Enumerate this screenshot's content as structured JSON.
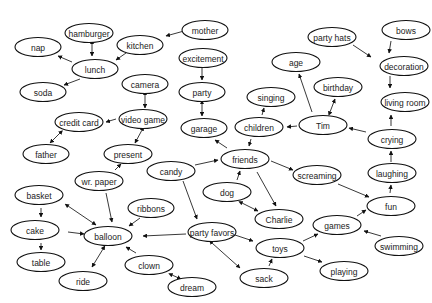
{
  "diagram": {
    "type": "concept-map",
    "nodes": [
      {
        "id": "hamburger",
        "label": "hamburger",
        "x": 89,
        "y": 33,
        "rx": 24
      },
      {
        "id": "nap",
        "label": "nap",
        "x": 38,
        "y": 47,
        "rx": 23
      },
      {
        "id": "kitchen",
        "label": "kitchen",
        "x": 140,
        "y": 45,
        "rx": 23
      },
      {
        "id": "mother",
        "label": "mother",
        "x": 205,
        "y": 30,
        "rx": 23
      },
      {
        "id": "lunch",
        "label": "lunch",
        "x": 95,
        "y": 69,
        "rx": 23
      },
      {
        "id": "soda",
        "label": "soda",
        "x": 43,
        "y": 92,
        "rx": 23
      },
      {
        "id": "excitement",
        "label": "excitement",
        "x": 203,
        "y": 58,
        "rx": 24
      },
      {
        "id": "party",
        "label": "party",
        "x": 202,
        "y": 92,
        "rx": 23
      },
      {
        "id": "garage",
        "label": "garage",
        "x": 204,
        "y": 128,
        "rx": 23
      },
      {
        "id": "camera",
        "label": "camera",
        "x": 145,
        "y": 84,
        "rx": 23
      },
      {
        "id": "video_game",
        "label": "video game",
        "x": 143,
        "y": 119,
        "rx": 24
      },
      {
        "id": "credit_card",
        "label": "credit card",
        "x": 79,
        "y": 122,
        "rx": 24
      },
      {
        "id": "father",
        "label": "father",
        "x": 46,
        "y": 154,
        "rx": 23
      },
      {
        "id": "present",
        "label": "present",
        "x": 128,
        "y": 154,
        "rx": 24
      },
      {
        "id": "wr_paper",
        "label": "wr. paper",
        "x": 99,
        "y": 181,
        "rx": 24
      },
      {
        "id": "candy",
        "label": "candy",
        "x": 171,
        "y": 171,
        "rx": 24
      },
      {
        "id": "party_hats",
        "label": "party hats",
        "x": 332,
        "y": 37,
        "rx": 24
      },
      {
        "id": "bows",
        "label": "bows",
        "x": 406,
        "y": 30,
        "rx": 24
      },
      {
        "id": "decoration",
        "label": "decoration",
        "x": 404,
        "y": 66,
        "rx": 24
      },
      {
        "id": "age",
        "label": "age",
        "x": 296,
        "y": 62,
        "rx": 24
      },
      {
        "id": "birthday",
        "label": "birthday",
        "x": 338,
        "y": 87,
        "rx": 24
      },
      {
        "id": "living_room",
        "label": "living room",
        "x": 405,
        "y": 102,
        "rx": 24
      },
      {
        "id": "singing",
        "label": "singing",
        "x": 271,
        "y": 97,
        "rx": 24
      },
      {
        "id": "children",
        "label": "children",
        "x": 259,
        "y": 127,
        "rx": 24
      },
      {
        "id": "tim",
        "label": "Tim",
        "x": 323,
        "y": 125,
        "rx": 24
      },
      {
        "id": "crying",
        "label": "crying",
        "x": 392,
        "y": 139,
        "rx": 24
      },
      {
        "id": "friends",
        "label": "friends",
        "x": 245,
        "y": 159,
        "rx": 24
      },
      {
        "id": "screaming",
        "label": "screaming",
        "x": 317,
        "y": 175,
        "rx": 24
      },
      {
        "id": "laughing",
        "label": "laughing",
        "x": 392,
        "y": 173,
        "rx": 24
      },
      {
        "id": "dog",
        "label": "dog",
        "x": 227,
        "y": 192,
        "rx": 24
      },
      {
        "id": "charlie",
        "label": "Charlie",
        "x": 279,
        "y": 219,
        "rx": 24
      },
      {
        "id": "fun",
        "label": "fun",
        "x": 391,
        "y": 206,
        "rx": 24
      },
      {
        "id": "basket",
        "label": "basket",
        "x": 39,
        "y": 195,
        "rx": 24
      },
      {
        "id": "ribbons",
        "label": "ribbons",
        "x": 151,
        "y": 208,
        "rx": 23
      },
      {
        "id": "cake",
        "label": "cake",
        "x": 35,
        "y": 230,
        "rx": 24
      },
      {
        "id": "balloon",
        "label": "balloon",
        "x": 108,
        "y": 236,
        "rx": 24
      },
      {
        "id": "party_favors",
        "label": "party favors",
        "x": 212,
        "y": 232,
        "rx": 24
      },
      {
        "id": "games",
        "label": "games",
        "x": 337,
        "y": 225,
        "rx": 24
      },
      {
        "id": "toys",
        "label": "toys",
        "x": 280,
        "y": 248,
        "rx": 24
      },
      {
        "id": "swimming",
        "label": "swimming",
        "x": 399,
        "y": 246,
        "rx": 24
      },
      {
        "id": "table",
        "label": "table",
        "x": 41,
        "y": 262,
        "rx": 24
      },
      {
        "id": "clown",
        "label": "clown",
        "x": 149,
        "y": 265,
        "rx": 24
      },
      {
        "id": "ride",
        "label": "ride",
        "x": 83,
        "y": 281,
        "rx": 24
      },
      {
        "id": "playing",
        "label": "playing",
        "x": 344,
        "y": 271,
        "rx": 24
      },
      {
        "id": "sack",
        "label": "sack",
        "x": 264,
        "y": 278,
        "rx": 24
      },
      {
        "id": "dream",
        "label": "dream",
        "x": 192,
        "y": 287,
        "rx": 24
      }
    ],
    "edges": [
      {
        "from": "mother",
        "to": "kitchen",
        "x1": 184,
        "y1": 31,
        "x2": 166,
        "y2": 36,
        "both": false
      },
      {
        "from": "kitchen",
        "to": "lunch",
        "x1": 126,
        "y1": 53,
        "x2": 116,
        "y2": 60,
        "both": false
      },
      {
        "from": "hamburger",
        "to": "lunch",
        "x1": 92,
        "y1": 44,
        "x2": 92,
        "y2": 56,
        "both": true
      },
      {
        "from": "lunch",
        "to": "nap",
        "x1": 72,
        "y1": 62,
        "x2": 58,
        "y2": 56,
        "both": false
      },
      {
        "from": "lunch",
        "to": "soda",
        "x1": 80,
        "y1": 79,
        "x2": 64,
        "y2": 85,
        "both": false
      },
      {
        "from": "excitement",
        "to": "party",
        "x1": 202,
        "y1": 68,
        "x2": 202,
        "y2": 80,
        "both": false
      },
      {
        "from": "party",
        "to": "garage",
        "x1": 202,
        "y1": 104,
        "x2": 202,
        "y2": 116,
        "both": true
      },
      {
        "from": "camera",
        "to": "video_game",
        "x1": 145,
        "y1": 95,
        "x2": 145,
        "y2": 108,
        "both": true
      },
      {
        "from": "video_game",
        "to": "credit_card",
        "x1": 116,
        "y1": 119,
        "x2": 106,
        "y2": 122,
        "both": false
      },
      {
        "from": "credit_card",
        "to": "father",
        "x1": 60,
        "y1": 133,
        "x2": 50,
        "y2": 143,
        "both": true
      },
      {
        "from": "video_game",
        "to": "present",
        "x1": 142,
        "y1": 130,
        "x2": 135,
        "y2": 143,
        "both": true
      },
      {
        "from": "wr_paper",
        "to": "present",
        "x1": 115,
        "y1": 170,
        "x2": 121,
        "y2": 164,
        "both": false
      },
      {
        "from": "wr_paper",
        "to": "balloon",
        "x1": 106,
        "y1": 193,
        "x2": 112,
        "y2": 222,
        "both": false
      },
      {
        "from": "ribbons",
        "to": "balloon",
        "x1": 140,
        "y1": 218,
        "x2": 129,
        "y2": 226,
        "both": false
      },
      {
        "from": "basket",
        "to": "balloon",
        "x1": 68,
        "y1": 206,
        "x2": 96,
        "y2": 225,
        "both": true
      },
      {
        "from": "basket",
        "to": "cake",
        "x1": 41,
        "y1": 208,
        "x2": 41,
        "y2": 217,
        "both": false
      },
      {
        "from": "cake",
        "to": "balloon",
        "x1": 68,
        "y1": 232,
        "x2": 84,
        "y2": 234,
        "both": false
      },
      {
        "from": "cake",
        "to": "table",
        "x1": 41,
        "y1": 243,
        "x2": 41,
        "y2": 250,
        "both": false
      },
      {
        "from": "balloon",
        "to": "ride",
        "x1": 103,
        "y1": 249,
        "x2": 92,
        "y2": 267,
        "both": true
      },
      {
        "from": "clown",
        "to": "balloon",
        "x1": 136,
        "y1": 253,
        "x2": 126,
        "y2": 247,
        "both": false
      },
      {
        "from": "clown",
        "to": "dream",
        "x1": 172,
        "y1": 275,
        "x2": 181,
        "y2": 279,
        "both": true
      },
      {
        "from": "party_favors",
        "to": "balloon",
        "x1": 186,
        "y1": 234,
        "x2": 143,
        "y2": 236,
        "both": false
      },
      {
        "from": "candy",
        "to": "party_favors",
        "x1": 183,
        "y1": 181,
        "x2": 197,
        "y2": 219,
        "both": false
      },
      {
        "from": "candy",
        "to": "friends",
        "x1": 195,
        "y1": 165,
        "x2": 218,
        "y2": 160,
        "both": false
      },
      {
        "from": "party_favors",
        "to": "toys",
        "x1": 232,
        "y1": 234,
        "x2": 253,
        "y2": 241,
        "both": false
      },
      {
        "from": "party_favors",
        "to": "sack",
        "x1": 212,
        "y1": 243,
        "x2": 240,
        "y2": 268,
        "both": true
      },
      {
        "from": "sack",
        "to": "toys",
        "x1": 269,
        "y1": 266,
        "x2": 272,
        "y2": 259,
        "both": false
      },
      {
        "from": "toys",
        "to": "games",
        "x1": 303,
        "y1": 241,
        "x2": 318,
        "y2": 234,
        "both": false
      },
      {
        "from": "toys",
        "to": "playing",
        "x1": 304,
        "y1": 256,
        "x2": 322,
        "y2": 262,
        "both": false
      },
      {
        "from": "games",
        "to": "fun",
        "x1": 357,
        "y1": 216,
        "x2": 366,
        "y2": 210,
        "both": false
      },
      {
        "from": "swimming",
        "to": "games",
        "x1": 381,
        "y1": 236,
        "x2": 364,
        "y2": 231,
        "both": false
      },
      {
        "from": "fun",
        "to": "laughing",
        "x1": 390,
        "y1": 193,
        "x2": 391,
        "y2": 185,
        "both": false
      },
      {
        "from": "laughing",
        "to": "crying",
        "x1": 391,
        "y1": 162,
        "x2": 391,
        "y2": 151,
        "both": false
      },
      {
        "from": "crying",
        "to": "living_room",
        "x1": 391,
        "y1": 126,
        "x2": 391,
        "y2": 115,
        "both": false
      },
      {
        "from": "crying",
        "to": "tim",
        "x1": 366,
        "y1": 132,
        "x2": 349,
        "y2": 128,
        "both": false
      },
      {
        "from": "decoration",
        "to": "living_room",
        "x1": 390,
        "y1": 76,
        "x2": 390,
        "y2": 88,
        "both": false
      },
      {
        "from": "bows",
        "to": "decoration",
        "x1": 391,
        "y1": 41,
        "x2": 389,
        "y2": 53,
        "both": false
      },
      {
        "from": "party_hats",
        "to": "decoration",
        "x1": 353,
        "y1": 45,
        "x2": 371,
        "y2": 57,
        "both": false
      },
      {
        "from": "tim",
        "to": "age",
        "x1": 312,
        "y1": 112,
        "x2": 299,
        "y2": 74,
        "both": false
      },
      {
        "from": "tim",
        "to": "birthday",
        "x1": 330,
        "y1": 112,
        "x2": 335,
        "y2": 99,
        "both": true
      },
      {
        "from": "tim",
        "to": "children",
        "x1": 297,
        "y1": 126,
        "x2": 287,
        "y2": 127,
        "both": false
      },
      {
        "from": "children",
        "to": "singing",
        "x1": 262,
        "y1": 115,
        "x2": 264,
        "y2": 108,
        "both": false
      },
      {
        "from": "children",
        "to": "friends",
        "x1": 251,
        "y1": 139,
        "x2": 249,
        "y2": 146,
        "both": false
      },
      {
        "from": "friends",
        "to": "garage",
        "x1": 227,
        "y1": 148,
        "x2": 215,
        "y2": 140,
        "both": false
      },
      {
        "from": "friends",
        "to": "screaming",
        "x1": 271,
        "y1": 161,
        "x2": 293,
        "y2": 170,
        "both": false
      },
      {
        "from": "screaming",
        "to": "fun",
        "x1": 338,
        "y1": 184,
        "x2": 369,
        "y2": 197,
        "both": false
      },
      {
        "from": "dog",
        "to": "friends",
        "x1": 237,
        "y1": 180,
        "x2": 240,
        "y2": 171,
        "both": false
      },
      {
        "from": "friends",
        "to": "charlie",
        "x1": 257,
        "y1": 172,
        "x2": 276,
        "y2": 206,
        "both": false
      },
      {
        "from": "dog",
        "to": "charlie",
        "x1": 242,
        "y1": 203,
        "x2": 258,
        "y2": 211,
        "both": true
      }
    ]
  },
  "colors": {
    "background": "#ffffff",
    "stroke": "#111111",
    "text": "#222222"
  }
}
